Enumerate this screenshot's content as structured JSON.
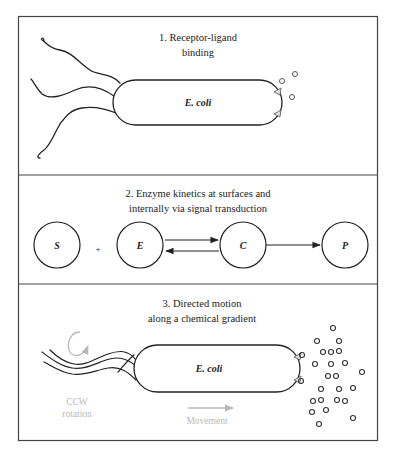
{
  "panels": [
    {
      "title_line1": "1. Receptor-ligand",
      "title_line2": "binding",
      "cell_label": "E. coli"
    },
    {
      "title_line1": "2. Enzyme kinetics at surfaces and",
      "title_line2": "internally via signal transduction",
      "species": [
        "S",
        "E",
        "C",
        "P"
      ],
      "plus": "+"
    },
    {
      "title_line1": "3. Directed motion",
      "title_line2": "along a chemical gradient",
      "cell_label": "E. coli",
      "rotation_line1": "CCW",
      "rotation_line2": "rotation",
      "movement_label": "Movement"
    }
  ],
  "colors": {
    "line": "#222222",
    "border": "#444444",
    "gray_annotation": "#b8b8b8"
  },
  "caption": "(cut-off caption text at bottom edge)"
}
